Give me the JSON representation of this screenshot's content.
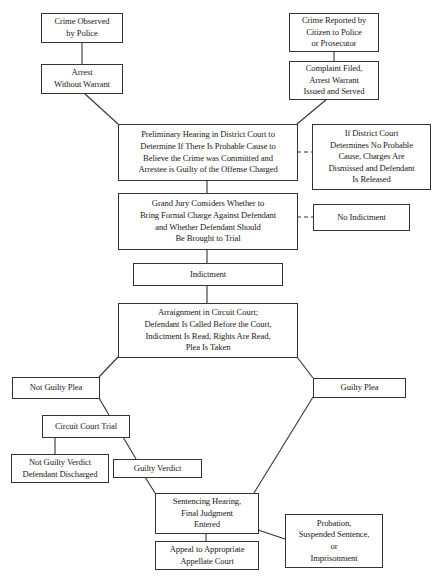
{
  "diagram": {
    "type": "flowchart",
    "nodes": {
      "crime_observed": "Crime Observed\nby Police",
      "arrest_without_warrant": "Arrest\nWithout Warrant",
      "crime_reported": "Crime Reported by\nCitizen to Police\nor Prosecutor",
      "complaint_filed": "Complaint Filed,\nArrest Warrant\nIssued and Served",
      "preliminary_hearing": "Preliminary Hearing in District Court to\nDetermine If There Is Probable Cause to\nBelieve the Crime was Committed and\nArrestee is Guilty of the Offense Charged",
      "no_probable_cause": "If District Court\nDetermines No Probable\nCause, Charges Are\nDismissed and Defendant\nIs Released",
      "grand_jury": "Grand Jury Considers Whether to\nBring Formal Charge Against Defendant\nand Whether Defendant Should\nBe Brought to Trial",
      "no_indictment": "No Indictment",
      "indictment": "Indictment",
      "arraignment": "Arraignment in Circuit Court;\nDefendant Is Called Before the Court,\nIndictment Is Read, Rights Are Read,\nPlea Is Taken",
      "not_guilty_plea": "Not Guilty Plea",
      "guilty_plea": "Guilty Plea",
      "circuit_court_trial": "Circuit Court Trial",
      "not_guilty_verdict": "Not Guilty Verdict\nDefendant Discharged",
      "guilty_verdict": "Guilty Verdict",
      "sentencing": "Sentencing Hearing,\nFinal Judgment\nEntered",
      "sentence_outcomes": "Probation,\nSuspended Sentence,\nor\nImprisonment",
      "appeal": "Appeal to Appropriate\nAppellate Court"
    },
    "edges": [
      {
        "from": "crime_observed",
        "to": "arrest_without_warrant",
        "style": "solid"
      },
      {
        "from": "crime_reported",
        "to": "complaint_filed",
        "style": "solid"
      },
      {
        "from": "arrest_without_warrant",
        "to": "preliminary_hearing",
        "style": "solid"
      },
      {
        "from": "complaint_filed",
        "to": "preliminary_hearing",
        "style": "solid"
      },
      {
        "from": "preliminary_hearing",
        "to": "no_probable_cause",
        "style": "dashed"
      },
      {
        "from": "preliminary_hearing",
        "to": "grand_jury",
        "style": "solid"
      },
      {
        "from": "grand_jury",
        "to": "no_indictment",
        "style": "dashed"
      },
      {
        "from": "grand_jury",
        "to": "indictment",
        "style": "solid"
      },
      {
        "from": "indictment",
        "to": "arraignment",
        "style": "solid"
      },
      {
        "from": "arraignment",
        "to": "not_guilty_plea",
        "style": "solid"
      },
      {
        "from": "arraignment",
        "to": "guilty_plea",
        "style": "solid"
      },
      {
        "from": "not_guilty_plea",
        "to": "circuit_court_trial",
        "style": "solid"
      },
      {
        "from": "circuit_court_trial",
        "to": "not_guilty_verdict",
        "style": "solid"
      },
      {
        "from": "circuit_court_trial",
        "to": "guilty_verdict",
        "style": "solid"
      },
      {
        "from": "guilty_verdict",
        "to": "sentencing",
        "style": "solid"
      },
      {
        "from": "guilty_plea",
        "to": "sentencing",
        "style": "solid"
      },
      {
        "from": "sentencing",
        "to": "sentence_outcomes",
        "style": "solid"
      },
      {
        "from": "sentencing",
        "to": "appeal",
        "style": "solid"
      }
    ]
  },
  "colors": {
    "line": "#333333",
    "background": "#ffffff",
    "text": "#1a1a1a"
  }
}
